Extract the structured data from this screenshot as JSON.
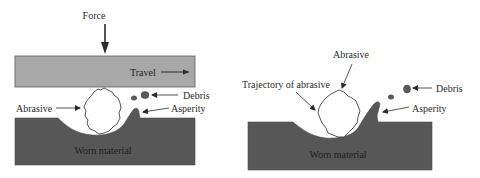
{
  "diagram": {
    "colors": {
      "background": "#ffffff",
      "plate": "#a8a8a8",
      "worn_material": "#575757",
      "debris": "#5a5a5a",
      "outline": "#2a2a2a",
      "text": "#2b2b2b"
    },
    "left_panel": {
      "description": "Two-body abrasion with sliding plate",
      "labels": {
        "force": "Force",
        "travel": "Travel",
        "abrasive": "Abrasive",
        "debris": "Debris",
        "asperity": "Asperity",
        "worn_material": "Worn material"
      }
    },
    "right_panel": {
      "description": "Three-body / free abrasive trajectory",
      "labels": {
        "abrasive": "Abrasive",
        "trajectory": "Trajectory of abrasive",
        "debris": "Debris",
        "asperity": "Asperity",
        "worn_material": "Worn material"
      }
    }
  }
}
